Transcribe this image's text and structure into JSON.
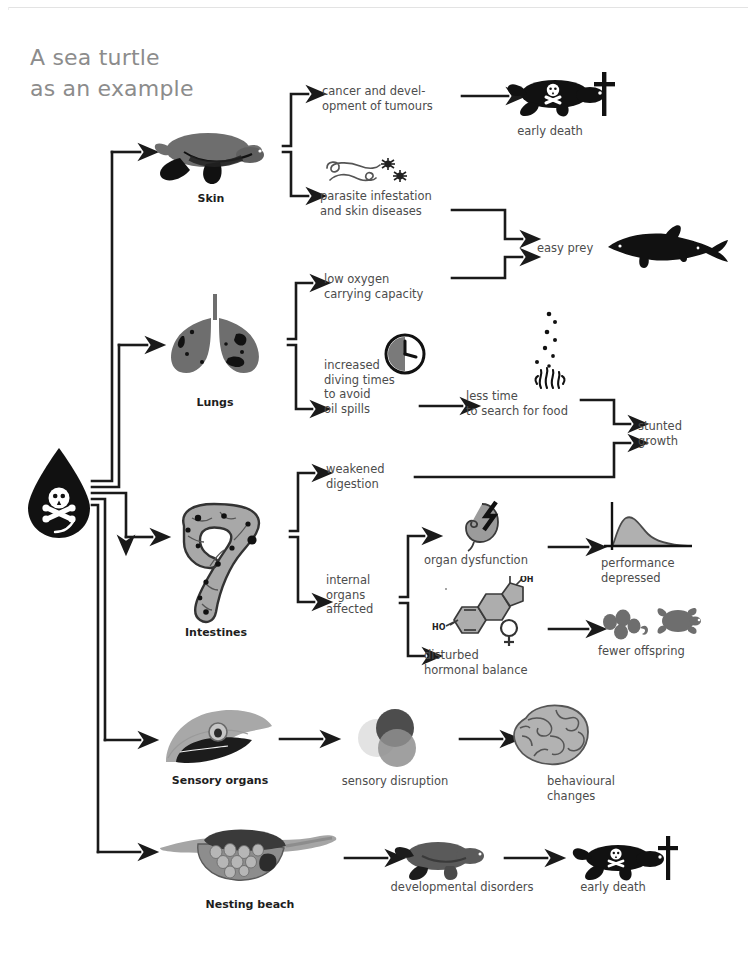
{
  "page": {
    "title_line1": "A sea turtle",
    "title_line2": "as an example",
    "title_color": "#8c8c8c",
    "background": "#ffffff",
    "text_color": "#4c4c4c",
    "bold_color": "#1e1e1e",
    "arrow_color": "#1a1a1a",
    "organ_gray": "#6e6e6e",
    "organ_light": "#a8a8a8",
    "dark": "#1a1a1a"
  },
  "source": {
    "name": "oil-drop-toxic",
    "icon": "oil-drop-with-skull"
  },
  "branches": [
    {
      "id": "skin",
      "organ_label": "Skin",
      "organ_icon": "sea-turtle-swimming",
      "effects": [
        {
          "id": "cancer",
          "lines": [
            "cancer and devel-",
            "opment of tumours"
          ],
          "icon": null,
          "outcome": {
            "id": "early-death-1",
            "label": "early death",
            "icon": "dead-turtle-with-skull-and-cross"
          }
        },
        {
          "id": "parasites",
          "lines": [
            "parasite infestation",
            "and skin diseases"
          ],
          "icon": "worms-and-mites"
        }
      ]
    },
    {
      "id": "lungs",
      "organ_label": "Lungs",
      "organ_icon": "lungs",
      "effects": [
        {
          "id": "low-oxygen",
          "lines": [
            "low oxygen",
            "carrying capacity"
          ],
          "icon": null
        },
        {
          "id": "diving-times",
          "lines": [
            "increased",
            "diving times",
            "to avoid",
            "oil spills"
          ],
          "icon": "clock"
        }
      ]
    },
    {
      "id": "intestines",
      "organ_label": "Intestines",
      "organ_icon": "intestines-with-oil-particles",
      "effects": [
        {
          "id": "weakened-digestion",
          "lines": [
            "weakened",
            "digestion"
          ],
          "icon": null
        },
        {
          "id": "internal-organs",
          "lines": [
            "internal",
            "organs",
            "affected"
          ],
          "icon": null,
          "children": [
            {
              "id": "organ-dysfunction",
              "lines": [
                "organ dysfunction"
              ],
              "icon": "kidney-with-lightning-bolt",
              "outcome": {
                "id": "performance-depressed",
                "lines": [
                  "performance",
                  "depressed"
                ],
                "icon": "skewed-distribution-curve"
              }
            },
            {
              "id": "hormonal-balance",
              "lines": [
                "disturbed",
                "hormonal balance"
              ],
              "icon": "estrogen-molecule-with-venus-symbol",
              "outcome": {
                "id": "fewer-offspring",
                "lines": [
                  "fewer offspring"
                ],
                "icon": "eggs-hatchling-and-turtle"
              }
            }
          ]
        }
      ]
    },
    {
      "id": "sensory-organs",
      "organ_label": "Sensory organs",
      "organ_icon": "turtle-head-with-eye",
      "effects": [
        {
          "id": "sensory-disruption",
          "lines": [
            "sensory disruption"
          ],
          "icon": "three-overlapping-circles",
          "outcome": {
            "id": "behavioural-changes",
            "lines": [
              "behavioural",
              "changes"
            ],
            "icon": "brain"
          }
        }
      ]
    },
    {
      "id": "nesting-beach",
      "organ_label": "Nesting beach",
      "organ_icon": "nest-with-eggs-on-beach",
      "effects": [
        {
          "id": "developmental-disorders",
          "lines": [
            "developmental disorders"
          ],
          "icon": "juvenile-turtle",
          "outcome": {
            "id": "early-death-2",
            "label": "early death",
            "icon": "dead-turtle-with-skull-and-cross"
          }
        }
      ]
    }
  ],
  "shared_outcomes": [
    {
      "id": "easy-prey",
      "label": "easy prey",
      "icon": "shark",
      "from": [
        "parasites",
        "low-oxygen"
      ]
    },
    {
      "id": "less-time-food",
      "lines": [
        "less time",
        "to search for food"
      ],
      "icon": "food-jellyfish-with-particles"
    },
    {
      "id": "stunted-growth",
      "lines": [
        "stunted",
        "growth"
      ],
      "from": [
        "less-time-food",
        "weakened-digestion"
      ]
    }
  ],
  "molecule": {
    "oh_label": "OH",
    "ho_label": "HO"
  }
}
